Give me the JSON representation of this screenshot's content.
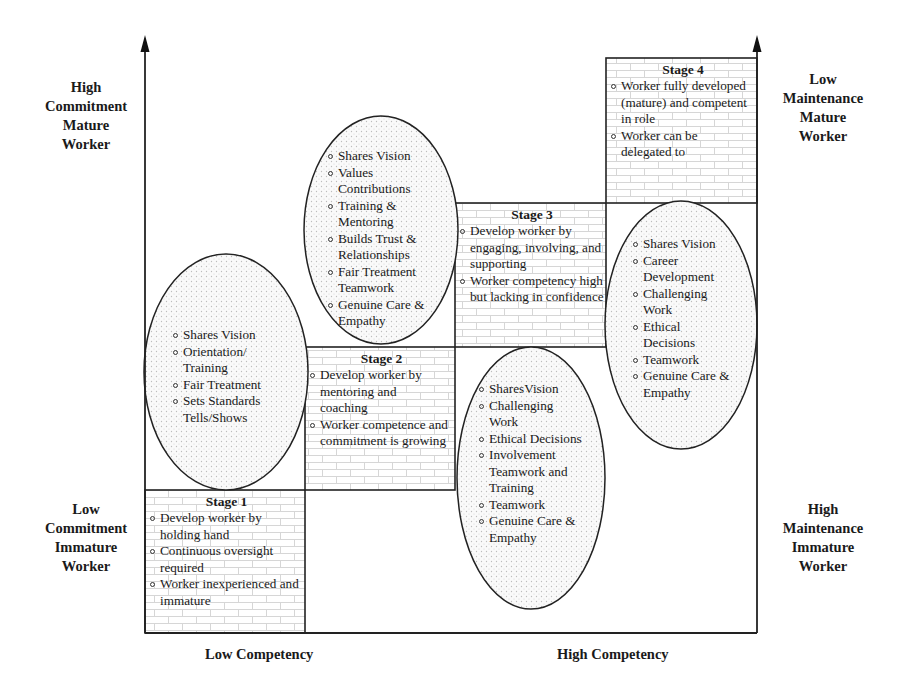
{
  "axes": {
    "y_left_top": [
      "High",
      "Commitment",
      "Mature",
      "Worker"
    ],
    "y_left_bottom": [
      "Low",
      "Commitment",
      "Immature",
      "Worker"
    ],
    "y_right_top": [
      "Low",
      "Maintenance",
      "Mature",
      "Worker"
    ],
    "y_right_bottom": [
      "High",
      "Maintenance",
      "Immature",
      "Worker"
    ],
    "x_left": "Low Competency",
    "x_right": "High Competency"
  },
  "stages": [
    {
      "title": "Stage 1",
      "items": [
        "Develop worker by holding hand",
        "Continuous oversight required",
        "Worker inexperienced and immature"
      ]
    },
    {
      "title": "Stage 2",
      "items": [
        "Develop worker by mentoring and coaching",
        "Worker competence and commitment is growing"
      ]
    },
    {
      "title": "Stage 3",
      "items": [
        "Develop worker by engaging, involving, and supporting",
        "Worker competency high but lacking in confidence"
      ]
    },
    {
      "title": "Stage 4",
      "items": [
        "Worker fully developed (mature) and competent in role",
        "Worker can be delegated to"
      ]
    }
  ],
  "ellipses": [
    {
      "items": [
        "Shares Vision",
        "Orientation/ Training",
        "Fair Treatment",
        "Sets Standards Tells/Shows"
      ]
    },
    {
      "items": [
        "Shares Vision",
        "Values Contributions",
        "Training & Mentoring",
        "Builds Trust & Relationships",
        "Fair Treatment Teamwork",
        "Genuine Care & Empathy"
      ]
    },
    {
      "items": [
        "SharesVision",
        "Challenging Work",
        "Ethical Decisions",
        "Involvement Teamwork and Training",
        "Teamwork",
        "Genuine Care & Empathy"
      ]
    },
    {
      "items": [
        "Shares Vision",
        "Career Development",
        "Challenging Work",
        "Ethical Decisions",
        "Teamwork",
        "Genuine Care & Empathy"
      ]
    }
  ],
  "colors": {
    "line": "#222222",
    "brick": "#d4d4d4",
    "dots": "#c8c8c8"
  }
}
